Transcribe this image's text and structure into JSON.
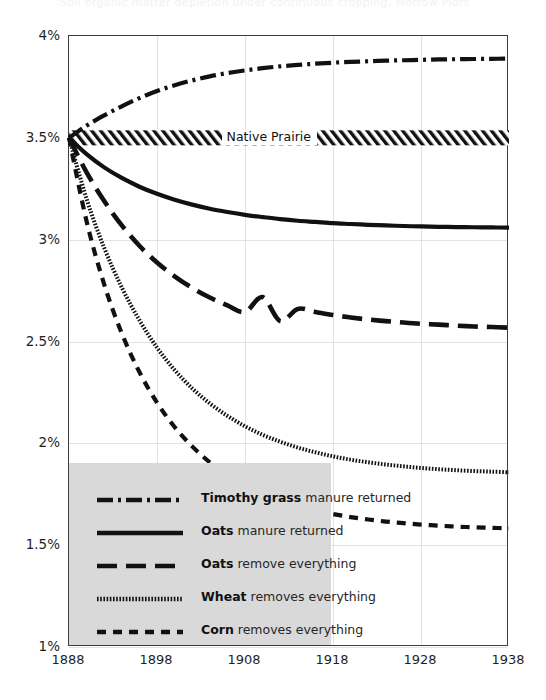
{
  "figure": {
    "cropped_title": "Soil organic matter depletion under continuous cropping, Morrow Plots",
    "background_color": "#ffffff",
    "frame_color": "#3d3d3d",
    "legend_background": "#d9d9d9",
    "series_color": "#111111"
  },
  "chart_data": {
    "type": "line",
    "title": "",
    "xlabel": "",
    "ylabel": "",
    "xlim": [
      1888,
      1938
    ],
    "ylim": [
      1.0,
      4.0
    ],
    "grid": true,
    "legend_position": "lower-left-inside",
    "x_ticks": [
      1888,
      1898,
      1908,
      1918,
      1928,
      1938
    ],
    "x_tick_labels": [
      "1888",
      "1898",
      "1908",
      "1918",
      "1928",
      "1938"
    ],
    "y_ticks": [
      1.0,
      1.5,
      2.0,
      2.5,
      3.0,
      3.5,
      4.0
    ],
    "y_tick_labels": [
      "1%",
      "1.5%",
      "2%",
      "2.5%",
      "3%",
      "3.5%",
      "4%"
    ],
    "x": [
      1888,
      1890,
      1892,
      1894,
      1896,
      1898,
      1900,
      1902,
      1904,
      1906,
      1908,
      1910,
      1912,
      1914,
      1916,
      1918,
      1920,
      1922,
      1924,
      1926,
      1928,
      1930,
      1932,
      1934,
      1936,
      1938
    ],
    "annotations": [
      {
        "text": "Native Prairie",
        "value": 3.5,
        "x": 1910,
        "style": "hatched-band"
      }
    ],
    "series": [
      {
        "name": "Timothy grass manure returned",
        "name_bold": "Timothy grass",
        "name_rest": "manure returned",
        "style": "dashdot",
        "values": [
          3.5,
          3.56,
          3.61,
          3.655,
          3.695,
          3.73,
          3.758,
          3.782,
          3.802,
          3.818,
          3.831,
          3.842,
          3.851,
          3.858,
          3.864,
          3.869,
          3.873,
          3.876,
          3.879,
          3.881,
          3.883,
          3.885,
          3.886,
          3.887,
          3.888,
          3.889
        ]
      },
      {
        "name": "Oats manure returned",
        "name_bold": "Oats",
        "name_rest": "manure returned",
        "style": "solid",
        "values": [
          3.5,
          3.42,
          3.355,
          3.303,
          3.26,
          3.225,
          3.196,
          3.172,
          3.152,
          3.136,
          3.122,
          3.111,
          3.101,
          3.093,
          3.087,
          3.081,
          3.077,
          3.073,
          3.07,
          3.067,
          3.065,
          3.063,
          3.062,
          3.061,
          3.06,
          3.059
        ]
      },
      {
        "name": "Oats remove everything",
        "name_bold": "Oats",
        "name_rest": "remove everything",
        "style": "longdash",
        "values": [
          3.5,
          3.33,
          3.19,
          3.07,
          2.97,
          2.888,
          2.82,
          2.763,
          2.716,
          2.677,
          2.645,
          2.718,
          2.6,
          2.66,
          2.645,
          2.63,
          2.618,
          2.608,
          2.6,
          2.593,
          2.587,
          2.583,
          2.578,
          2.574,
          2.571,
          2.568
        ]
      },
      {
        "name": "Wheat removes everything",
        "name_bold": "Wheat",
        "name_rest": "removes everything",
        "style": "finedot",
        "values": [
          3.5,
          3.2,
          2.96,
          2.765,
          2.605,
          2.47,
          2.36,
          2.27,
          2.196,
          2.135,
          2.084,
          2.042,
          2.008,
          1.979,
          1.956,
          1.936,
          1.92,
          1.907,
          1.896,
          1.887,
          1.879,
          1.873,
          1.868,
          1.864,
          1.861,
          1.858
        ]
      },
      {
        "name": "Corn removes everything",
        "name_bold": "Corn",
        "name_rest": "removes everything",
        "style": "dash",
        "values": [
          3.5,
          3.09,
          2.78,
          2.54,
          2.35,
          2.2,
          2.08,
          1.985,
          1.907,
          1.845,
          1.795,
          1.754,
          1.72,
          1.693,
          1.671,
          1.653,
          1.638,
          1.626,
          1.616,
          1.608,
          1.601,
          1.596,
          1.591,
          1.588,
          1.585,
          1.583
        ]
      }
    ]
  },
  "legend": {
    "items": [
      {
        "bold": "Timothy grass",
        "rest": "manure returned",
        "style": "dashdot"
      },
      {
        "bold": "Oats",
        "rest": "manure returned",
        "style": "solid"
      },
      {
        "bold": "Oats",
        "rest": "remove everything",
        "style": "longdash"
      },
      {
        "bold": "Wheat",
        "rest": "removes everything",
        "style": "finedot"
      },
      {
        "bold": "Corn",
        "rest": "removes everything",
        "style": "dash"
      }
    ]
  }
}
